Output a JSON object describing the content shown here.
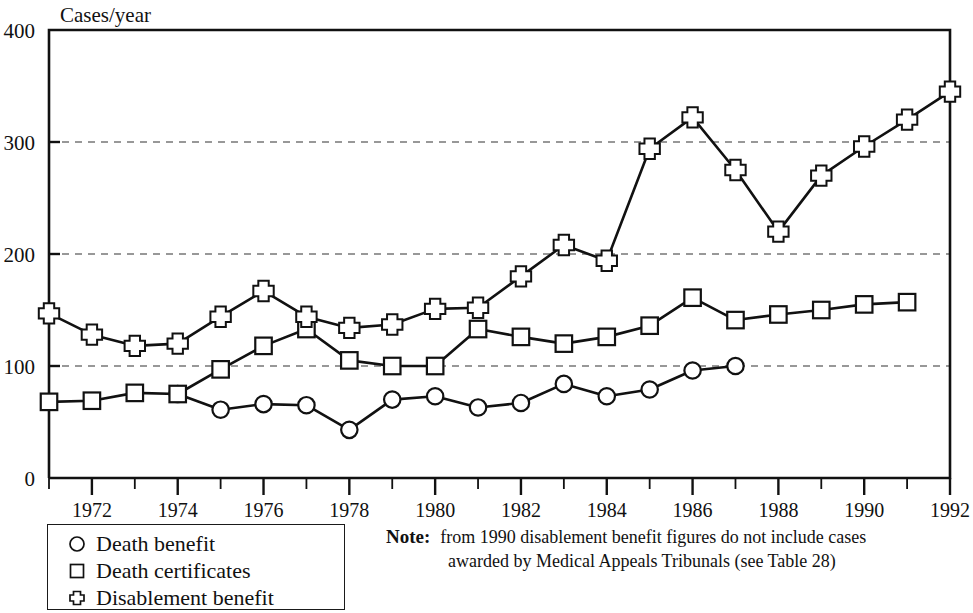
{
  "chart_data": {
    "type": "line",
    "title": "",
    "ylabel": "Cases/year",
    "xlabel": "",
    "ylim": [
      0,
      400
    ],
    "xlim": [
      1971,
      1992
    ],
    "yticks": [
      0,
      100,
      200,
      300,
      400
    ],
    "ytick_labels": [
      "0",
      "100",
      "200",
      "300",
      "400"
    ],
    "xticks": [
      1971,
      1972,
      1973,
      1974,
      1975,
      1976,
      1977,
      1978,
      1979,
      1980,
      1981,
      1982,
      1983,
      1984,
      1985,
      1986,
      1987,
      1988,
      1989,
      1990,
      1991,
      1992
    ],
    "xtick_labels": [
      "",
      "1972",
      "",
      "1974",
      "",
      "1976",
      "",
      "1978",
      "",
      "1980",
      "",
      "1982",
      "",
      "1984",
      "",
      "1986",
      "",
      "1988",
      "",
      "1990",
      "",
      "1992"
    ],
    "grid": "horizontal-dashed at 100, 200, 300",
    "legend_position": "below-left",
    "series": [
      {
        "name": "Death benefit",
        "marker": "circle",
        "x": [
          1971,
          1972,
          1973,
          1974,
          1975,
          1976,
          1977,
          1978,
          1979,
          1980,
          1981,
          1982,
          1983,
          1984,
          1985,
          1986,
          1987
        ],
        "values": [
          null,
          null,
          null,
          75,
          61,
          66,
          65,
          43,
          70,
          73,
          63,
          67,
          84,
          73,
          79,
          96,
          100
        ]
      },
      {
        "name": "Death certificates",
        "marker": "square",
        "x": [
          1971,
          1972,
          1973,
          1974,
          1975,
          1976,
          1977,
          1978,
          1979,
          1980,
          1981,
          1982,
          1983,
          1984,
          1985,
          1986,
          1987,
          1988,
          1989,
          1990,
          1991
        ],
        "values": [
          68,
          69,
          76,
          75,
          97,
          118,
          133,
          105,
          100,
          100,
          133,
          126,
          120,
          126,
          136,
          161,
          141,
          146,
          150,
          155,
          157
        ]
      },
      {
        "name": "Disablement benefit",
        "marker": "cross",
        "x": [
          1971,
          1972,
          1973,
          1974,
          1975,
          1976,
          1977,
          1978,
          1979,
          1980,
          1981,
          1982,
          1983,
          1984,
          1985,
          1986,
          1987,
          1988,
          1989,
          1990,
          1991,
          1992
        ],
        "values": [
          147,
          128,
          118,
          120,
          144,
          167,
          144,
          134,
          137,
          151,
          152,
          180,
          208,
          194,
          294,
          322,
          275,
          220,
          270,
          296,
          320,
          345
        ]
      }
    ]
  },
  "legend": {
    "items": [
      {
        "marker": "circle",
        "label": "Death benefit"
      },
      {
        "marker": "square",
        "label": "Death certificates"
      },
      {
        "marker": "cross",
        "label": "Disablement benefit"
      }
    ]
  },
  "note": {
    "label": "Note:",
    "line1": "from 1990 disablement benefit  figures do not include cases",
    "line2": "awarded by Medical  Appeals Tribunals (see Table 28)"
  },
  "colors": {
    "ink": "#111111",
    "grid": "#333333",
    "background": "#ffffff"
  }
}
